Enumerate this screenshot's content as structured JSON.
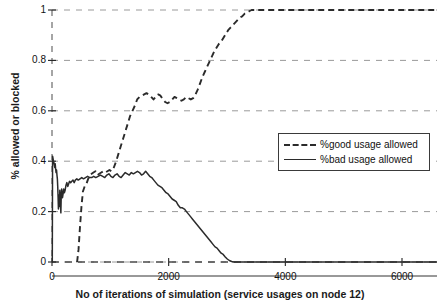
{
  "chart_data": {
    "type": "line",
    "title": "",
    "xlabel": "No of iterations of simulation (service usages on node 12)",
    "ylabel": "% allowed or blocked",
    "xlim": [
      0,
      6600
    ],
    "ylim": [
      0,
      1
    ],
    "xticks": [
      0,
      2000,
      4000,
      6000
    ],
    "xtick_labels": [
      "0",
      "2000",
      "4000",
      "6000"
    ],
    "yticks": [
      0,
      0.2,
      0.4,
      0.6,
      0.8,
      1
    ],
    "ytick_labels": [
      "0",
      "0.2",
      "0.4",
      "0.6",
      "0.8",
      "1"
    ],
    "grid": true,
    "grid_style": "dashed",
    "legend_position": "center-right",
    "series": [
      {
        "name": "%good usage allowed",
        "style": "dashed",
        "color": "#2b2b2b",
        "points": [
          [
            430,
            0.0
          ],
          [
            455,
            0.05
          ],
          [
            480,
            0.14
          ],
          [
            505,
            0.22
          ],
          [
            530,
            0.28
          ],
          [
            560,
            0.3
          ],
          [
            590,
            0.31
          ],
          [
            620,
            0.33
          ],
          [
            650,
            0.345
          ],
          [
            680,
            0.35
          ],
          [
            710,
            0.355
          ],
          [
            745,
            0.36
          ],
          [
            780,
            0.345
          ],
          [
            810,
            0.35
          ],
          [
            845,
            0.355
          ],
          [
            880,
            0.36
          ],
          [
            915,
            0.355
          ],
          [
            950,
            0.36
          ],
          [
            985,
            0.365
          ],
          [
            1020,
            0.36
          ],
          [
            1060,
            0.375
          ],
          [
            1100,
            0.4
          ],
          [
            1140,
            0.43
          ],
          [
            1180,
            0.46
          ],
          [
            1220,
            0.49
          ],
          [
            1260,
            0.52
          ],
          [
            1300,
            0.55
          ],
          [
            1340,
            0.58
          ],
          [
            1380,
            0.6
          ],
          [
            1420,
            0.62
          ],
          [
            1460,
            0.645
          ],
          [
            1500,
            0.655
          ],
          [
            1540,
            0.66
          ],
          [
            1580,
            0.665
          ],
          [
            1620,
            0.67
          ],
          [
            1660,
            0.665
          ],
          [
            1700,
            0.655
          ],
          [
            1740,
            0.645
          ],
          [
            1780,
            0.655
          ],
          [
            1820,
            0.665
          ],
          [
            1860,
            0.66
          ],
          [
            1900,
            0.645
          ],
          [
            1940,
            0.635
          ],
          [
            1980,
            0.63
          ],
          [
            2020,
            0.635
          ],
          [
            2060,
            0.645
          ],
          [
            2100,
            0.655
          ],
          [
            2140,
            0.65
          ],
          [
            2180,
            0.645
          ],
          [
            2220,
            0.64
          ],
          [
            2260,
            0.645
          ],
          [
            2300,
            0.655
          ],
          [
            2340,
            0.65
          ],
          [
            2380,
            0.645
          ],
          [
            2420,
            0.65
          ],
          [
            2460,
            0.665
          ],
          [
            2500,
            0.685
          ],
          [
            2540,
            0.71
          ],
          [
            2580,
            0.735
          ],
          [
            2620,
            0.755
          ],
          [
            2660,
            0.775
          ],
          [
            2700,
            0.795
          ],
          [
            2740,
            0.815
          ],
          [
            2780,
            0.835
          ],
          [
            2820,
            0.85
          ],
          [
            2860,
            0.865
          ],
          [
            2900,
            0.875
          ],
          [
            2940,
            0.89
          ],
          [
            2980,
            0.905
          ],
          [
            3020,
            0.92
          ],
          [
            3060,
            0.93
          ],
          [
            3100,
            0.94
          ],
          [
            3140,
            0.95
          ],
          [
            3180,
            0.96
          ],
          [
            3220,
            0.97
          ],
          [
            3260,
            0.975
          ],
          [
            3300,
            0.985
          ],
          [
            3340,
            0.99
          ],
          [
            3380,
            0.995
          ],
          [
            3420,
            1.0
          ],
          [
            3600,
            1.0
          ],
          [
            4000,
            1.0
          ],
          [
            4500,
            1.0
          ],
          [
            5000,
            1.0
          ],
          [
            5500,
            1.0
          ],
          [
            6000,
            1.0
          ],
          [
            6400,
            1.0
          ],
          [
            6600,
            1.0
          ]
        ]
      },
      {
        "name": "%bad usage allowed",
        "style": "solid",
        "color": "#2b2b2b",
        "points": [
          [
            5,
            0.0
          ],
          [
            10,
            0.42
          ],
          [
            18,
            0.41
          ],
          [
            25,
            0.4
          ],
          [
            32,
            0.395
          ],
          [
            40,
            0.385
          ],
          [
            48,
            0.375
          ],
          [
            55,
            0.39
          ],
          [
            62,
            0.37
          ],
          [
            70,
            0.355
          ],
          [
            78,
            0.365
          ],
          [
            85,
            0.345
          ],
          [
            92,
            0.33
          ],
          [
            98,
            0.3
          ],
          [
            104,
            0.26
          ],
          [
            110,
            0.21
          ],
          [
            116,
            0.265
          ],
          [
            122,
            0.245
          ],
          [
            128,
            0.22
          ],
          [
            134,
            0.285
          ],
          [
            140,
            0.255
          ],
          [
            146,
            0.225
          ],
          [
            152,
            0.195
          ],
          [
            158,
            0.26
          ],
          [
            165,
            0.29
          ],
          [
            172,
            0.275
          ],
          [
            180,
            0.255
          ],
          [
            190,
            0.27
          ],
          [
            200,
            0.29
          ],
          [
            212,
            0.275
          ],
          [
            225,
            0.285
          ],
          [
            240,
            0.305
          ],
          [
            255,
            0.315
          ],
          [
            270,
            0.3
          ],
          [
            285,
            0.31
          ],
          [
            300,
            0.32
          ],
          [
            320,
            0.315
          ],
          [
            340,
            0.32
          ],
          [
            360,
            0.325
          ],
          [
            380,
            0.315
          ],
          [
            400,
            0.325
          ],
          [
            425,
            0.33
          ],
          [
            450,
            0.325
          ],
          [
            480,
            0.33
          ],
          [
            510,
            0.335
          ],
          [
            540,
            0.33
          ],
          [
            575,
            0.335
          ],
          [
            610,
            0.34
          ],
          [
            645,
            0.335
          ],
          [
            680,
            0.335
          ],
          [
            715,
            0.34
          ],
          [
            750,
            0.335
          ],
          [
            790,
            0.34
          ],
          [
            830,
            0.345
          ],
          [
            870,
            0.34
          ],
          [
            905,
            0.335
          ],
          [
            940,
            0.345
          ],
          [
            975,
            0.35
          ],
          [
            1010,
            0.34
          ],
          [
            1045,
            0.335
          ],
          [
            1080,
            0.345
          ],
          [
            1115,
            0.35
          ],
          [
            1150,
            0.34
          ],
          [
            1185,
            0.335
          ],
          [
            1220,
            0.345
          ],
          [
            1255,
            0.355
          ],
          [
            1290,
            0.35
          ],
          [
            1325,
            0.345
          ],
          [
            1360,
            0.355
          ],
          [
            1395,
            0.35
          ],
          [
            1430,
            0.355
          ],
          [
            1465,
            0.36
          ],
          [
            1500,
            0.355
          ],
          [
            1535,
            0.345
          ],
          [
            1570,
            0.35
          ],
          [
            1605,
            0.36
          ],
          [
            1640,
            0.35
          ],
          [
            1675,
            0.34
          ],
          [
            1710,
            0.335
          ],
          [
            1745,
            0.325
          ],
          [
            1780,
            0.315
          ],
          [
            1815,
            0.305
          ],
          [
            1850,
            0.3
          ],
          [
            1885,
            0.295
          ],
          [
            1920,
            0.285
          ],
          [
            1955,
            0.275
          ],
          [
            1990,
            0.27
          ],
          [
            2025,
            0.26
          ],
          [
            2060,
            0.25
          ],
          [
            2095,
            0.245
          ],
          [
            2130,
            0.24
          ],
          [
            2165,
            0.225
          ],
          [
            2200,
            0.215
          ],
          [
            2235,
            0.215
          ],
          [
            2270,
            0.21
          ],
          [
            2305,
            0.2
          ],
          [
            2340,
            0.19
          ],
          [
            2375,
            0.18
          ],
          [
            2410,
            0.17
          ],
          [
            2445,
            0.16
          ],
          [
            2480,
            0.15
          ],
          [
            2515,
            0.14
          ],
          [
            2550,
            0.13
          ],
          [
            2585,
            0.12
          ],
          [
            2620,
            0.11
          ],
          [
            2655,
            0.1
          ],
          [
            2690,
            0.09
          ],
          [
            2725,
            0.08
          ],
          [
            2760,
            0.07
          ],
          [
            2795,
            0.06
          ],
          [
            2830,
            0.055
          ],
          [
            2865,
            0.045
          ],
          [
            2900,
            0.035
          ],
          [
            2935,
            0.03
          ],
          [
            2970,
            0.02
          ],
          [
            3005,
            0.012
          ],
          [
            3040,
            0.006
          ],
          [
            3080,
            0.002
          ],
          [
            3120,
            0.0
          ],
          [
            3400,
            0.0
          ],
          [
            4000,
            0.0
          ],
          [
            4600,
            0.0
          ],
          [
            5200,
            0.0
          ],
          [
            5800,
            0.0
          ],
          [
            6200,
            0.0
          ],
          [
            6600,
            0.0
          ]
        ]
      }
    ]
  },
  "legend": {
    "items": [
      {
        "label": "%good usage allowed"
      },
      {
        "label": "%bad usage allowed"
      }
    ]
  }
}
